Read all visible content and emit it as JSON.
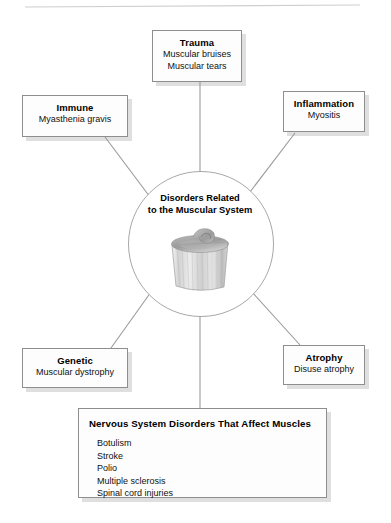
{
  "figure": {
    "center": {
      "title_line1": "Disorders Related",
      "title_line2": "to the Muscular System",
      "illustration": "muscle-tissue-illustration"
    },
    "nodes": [
      {
        "id": "trauma",
        "title": "Trauma",
        "items": [
          "Muscular bruises",
          "Muscular tears"
        ]
      },
      {
        "id": "immune",
        "title": "Immune",
        "items": [
          "Myasthenia gravis"
        ]
      },
      {
        "id": "inflammation",
        "title": "Inflammation",
        "items": [
          "Myositis"
        ]
      },
      {
        "id": "genetic",
        "title": "Genetic",
        "items": [
          "Muscular dystrophy"
        ]
      },
      {
        "id": "atrophy",
        "title": "Atrophy",
        "items": [
          "Disuse atrophy"
        ]
      },
      {
        "id": "nervous",
        "title": "Nervous System Disorders That Affect Muscles",
        "items": [
          "Botulism",
          "Stroke",
          "Polio",
          "Multiple sclerosis",
          "Spinal cord injuries"
        ]
      }
    ]
  },
  "colors": {
    "background": "#ffffff",
    "box_fill": "#fdfdfd",
    "box_border": "#8e8e8e",
    "box_shadow": "#c8c8c8",
    "connector": "#9a9a9a",
    "circle_border": "#a8a8a8",
    "text": "#000000",
    "top_rule": "#cccccc"
  }
}
